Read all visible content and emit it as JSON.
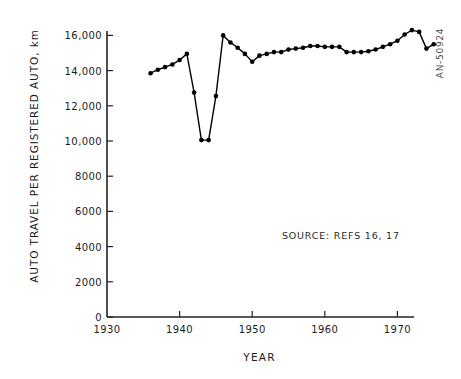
{
  "figure": {
    "doc_code": "AN-50924",
    "source_note": "SOURCE:   REFS 16, 17"
  },
  "chart_data": {
    "type": "line",
    "title": "",
    "xlabel": "YEAR",
    "ylabel": "AUTO TRAVEL PER REGISTERED AUTO, km",
    "xlim": [
      1930,
      1976
    ],
    "ylim": [
      0,
      17000
    ],
    "grid": false,
    "legend": null,
    "marker": "filled-circle",
    "line_color": "#000000",
    "xticks": [
      1930,
      1940,
      1950,
      1960,
      1970
    ],
    "xtick_labels": [
      "1930",
      "1940",
      "1950",
      "1960",
      "1970"
    ],
    "yticks": [
      0,
      2000,
      4000,
      6000,
      8000,
      10000,
      12000,
      14000,
      16000
    ],
    "ytick_labels": [
      "0",
      "2000",
      "4000",
      "6000",
      "8000",
      "10,000",
      "12,000",
      "14,000",
      "16,000"
    ],
    "x": [
      1936,
      1937,
      1938,
      1939,
      1940,
      1941,
      1942,
      1943,
      1944,
      1945,
      1946,
      1947,
      1948,
      1949,
      1950,
      1951,
      1952,
      1953,
      1954,
      1955,
      1956,
      1957,
      1958,
      1959,
      1960,
      1961,
      1962,
      1963,
      1964,
      1965,
      1966,
      1967,
      1968,
      1969,
      1970,
      1971,
      1972,
      1973,
      1974,
      1975
    ],
    "values": [
      13850,
      14050,
      14200,
      14350,
      14600,
      14950,
      12750,
      10050,
      10050,
      12550,
      16000,
      15600,
      15300,
      14950,
      14500,
      14850,
      14950,
      15050,
      15050,
      15200,
      15250,
      15300,
      15400,
      15400,
      15350,
      15350,
      15350,
      15050,
      15050,
      15050,
      15100,
      15200,
      15350,
      15500,
      15700,
      16050,
      16300,
      16200,
      15250,
      15500
    ]
  }
}
